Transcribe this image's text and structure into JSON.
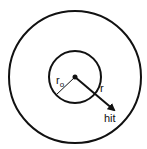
{
  "diagram": {
    "outer_circle": {
      "cx": 75,
      "cy": 77,
      "r": 66
    },
    "inner_circle": {
      "cx": 75,
      "cy": 77,
      "r": 26
    },
    "labels": {
      "inner_radius": "r",
      "inner_radius_sub": "o",
      "radius": "r",
      "hit": "hit"
    },
    "colors": {
      "stroke": "#111111",
      "background": "#ffffff"
    }
  }
}
